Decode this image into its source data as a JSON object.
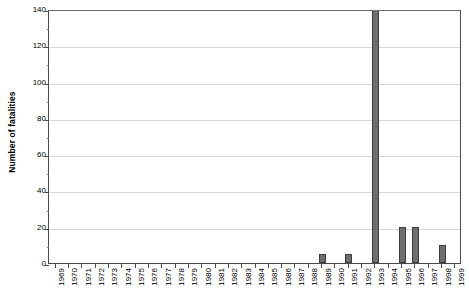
{
  "chart_data": {
    "type": "bar",
    "title": "",
    "subtitle": "",
    "xlabel": "",
    "ylabel": "Number of fatalities",
    "ylim": [
      0,
      140
    ],
    "ytick_step": 20,
    "yticks": [
      0,
      20,
      40,
      60,
      80,
      100,
      120,
      140
    ],
    "ytick_labels": [
      "0",
      "20",
      "40",
      "60",
      "80",
      "100",
      "120",
      "140"
    ],
    "minor_ytick_step": 10,
    "grid": "horizontal",
    "legend": "none",
    "bar_color": "#6e6e6e",
    "bar_edge_color": "#3d3d3d",
    "gridline_color": "#d9d9d9",
    "axis_color": "#4a4a4a",
    "categories": [
      "1969",
      "1970",
      "1971",
      "1972",
      "1973",
      "1974",
      "1975",
      "1976",
      "1977",
      "1978",
      "1979",
      "1980",
      "1981",
      "1982",
      "1983",
      "1984",
      "1985",
      "1986",
      "1987",
      "1988",
      "1989",
      "1990",
      "1991",
      "1992",
      "1993",
      "1994",
      "1995",
      "1996",
      "1997",
      "1998",
      "1999"
    ],
    "values": [
      0,
      0,
      0,
      0,
      0,
      0,
      0,
      0,
      0,
      0,
      0,
      0,
      0,
      0,
      0,
      0,
      0,
      0,
      0,
      0,
      5,
      0,
      5,
      0,
      140,
      0,
      20,
      20,
      0,
      10,
      0
    ],
    "notes": {
      "clipped_bar_category": "1993",
      "clipped_bar_reaches_axis_top": "140"
    }
  }
}
